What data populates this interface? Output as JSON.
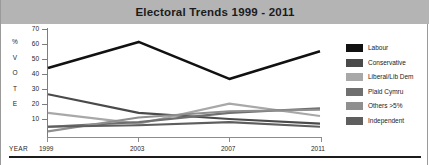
{
  "header": {
    "title": "Electoral Trends 1999 - 2011"
  },
  "axes": {
    "y_axis_caption_chars": [
      "%",
      "V",
      "O",
      "T",
      "E"
    ],
    "y_ticks": [
      "70",
      "60",
      "50",
      "40",
      "30",
      "20",
      "10"
    ],
    "x_axis_caption": "YEAR",
    "x_ticks": [
      "1999",
      "2003",
      "2007",
      "2011"
    ]
  },
  "legend": {
    "items": [
      {
        "label": "Labour",
        "color": "#111111"
      },
      {
        "label": "Conservative",
        "color": "#4a4a4a"
      },
      {
        "label": "Liberal/Lib Dem",
        "color": "#a8a8a8"
      },
      {
        "label": "Plaid Cymru",
        "color": "#6f6f6f"
      },
      {
        "label": "Others >5%",
        "color": "#8f8f8f"
      },
      {
        "label": "Independent",
        "color": "#5e5e5e"
      }
    ]
  },
  "chart_data": {
    "type": "line",
    "title": "Electoral Trends 1999 - 2011",
    "xlabel": "YEAR",
    "ylabel": "% VOTE",
    "categories": [
      "1999",
      "2003",
      "2007",
      "2011"
    ],
    "x": [
      1999,
      2003,
      2007,
      2011
    ],
    "ylim": [
      0,
      70
    ],
    "xlim": [
      1999,
      2011
    ],
    "grid": false,
    "legend_position": "right",
    "series": [
      {
        "name": "Labour",
        "color": "#111111",
        "values": [
          44,
          61,
          37,
          55
        ]
      },
      {
        "name": "Conservative",
        "color": "#4a4a4a",
        "values": [
          27,
          15,
          11,
          8
        ]
      },
      {
        "name": "Liberal/Lib Dem",
        "color": "#a8a8a8",
        "values": [
          15,
          8,
          21,
          13
        ]
      },
      {
        "name": "Plaid Cymru",
        "color": "#6f6f6f",
        "values": [
          6,
          9,
          15,
          18
        ]
      },
      {
        "name": "Others >5%",
        "color": "#8f8f8f",
        "values": [
          3,
          12,
          16,
          17
        ]
      },
      {
        "name": "Independent",
        "color": "#5e5e5e",
        "values": [
          6,
          7,
          9,
          6
        ]
      }
    ]
  }
}
